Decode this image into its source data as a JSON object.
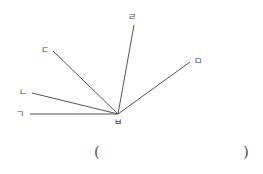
{
  "diagram": {
    "vertex": {
      "label": "ㅂ",
      "x": 118,
      "y": 114,
      "label_x": 118,
      "label_y": 122
    },
    "rays": [
      {
        "label": "ㄱ",
        "x": 30,
        "y": 114,
        "label_x": 20,
        "label_y": 114
      },
      {
        "label": "ㄴ",
        "x": 32,
        "y": 93,
        "label_x": 23,
        "label_y": 92
      },
      {
        "label": "ㄷ",
        "x": 53,
        "y": 51,
        "label_x": 45,
        "label_y": 50
      },
      {
        "label": "ㄹ",
        "x": 134,
        "y": 25,
        "label_x": 132,
        "label_y": 17
      },
      {
        "label": "ㅁ",
        "x": 190,
        "y": 62,
        "label_x": 198,
        "label_y": 61
      }
    ],
    "line_color": "#555555"
  },
  "answer": {
    "open_paren": "(",
    "close_paren": ")",
    "value": ""
  }
}
